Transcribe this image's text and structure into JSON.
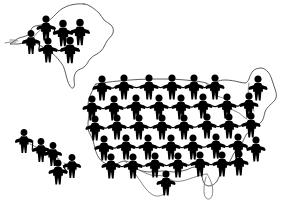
{
  "figure": {
    "background_color": "#ffffff",
    "figure_color": "#000000",
    "outline_color": "#4a4a4a",
    "canvas": {
      "width": 283,
      "height": 205
    }
  },
  "chart_data": {
    "type": "pictogram_map",
    "unit_symbol": "paper-doll human silhouette",
    "total_figures": 50,
    "regions": [
      {
        "name": "Alaska",
        "figure_count": 6
      },
      {
        "name": "Hawaii",
        "figure_count": 5
      },
      {
        "name": "Continental United States",
        "figure_count": 39
      }
    ]
  },
  "regions": {
    "alaska": {
      "name": "Alaska",
      "figures": [
        {
          "x": 46,
          "y": 28,
          "scale": 1.0
        },
        {
          "x": 63,
          "y": 33,
          "scale": 1.05
        },
        {
          "x": 80,
          "y": 32,
          "scale": 1.05
        },
        {
          "x": 31,
          "y": 42,
          "scale": 0.95
        },
        {
          "x": 48,
          "y": 50,
          "scale": 1.0
        },
        {
          "x": 70,
          "y": 50,
          "scale": 1.05
        }
      ]
    },
    "hawaii": {
      "name": "Hawaii",
      "figures": [
        {
          "x": 24,
          "y": 141,
          "scale": 0.95
        },
        {
          "x": 41,
          "y": 150,
          "scale": 0.95
        },
        {
          "x": 53,
          "y": 154,
          "scale": 0.95
        },
        {
          "x": 58,
          "y": 172,
          "scale": 1.0
        },
        {
          "x": 72,
          "y": 166,
          "scale": 0.95
        }
      ]
    },
    "continental": {
      "name": "Continental United States",
      "figures": [
        {
          "x": 102,
          "y": 88,
          "scale": 1.0
        },
        {
          "x": 124,
          "y": 87,
          "scale": 1.0
        },
        {
          "x": 149,
          "y": 87,
          "scale": 1.0
        },
        {
          "x": 172,
          "y": 87,
          "scale": 1.0
        },
        {
          "x": 194,
          "y": 87,
          "scale": 1.0
        },
        {
          "x": 215,
          "y": 87,
          "scale": 1.0
        },
        {
          "x": 258,
          "y": 88,
          "scale": 1.0
        },
        {
          "x": 92,
          "y": 108,
          "scale": 1.0
        },
        {
          "x": 114,
          "y": 108,
          "scale": 1.0
        },
        {
          "x": 136,
          "y": 107,
          "scale": 1.0
        },
        {
          "x": 159,
          "y": 107,
          "scale": 1.0
        },
        {
          "x": 181,
          "y": 107,
          "scale": 1.0
        },
        {
          "x": 203,
          "y": 106,
          "scale": 1.0
        },
        {
          "x": 227,
          "y": 106,
          "scale": 1.0
        },
        {
          "x": 249,
          "y": 105,
          "scale": 1.0
        },
        {
          "x": 95,
          "y": 128,
          "scale": 1.0
        },
        {
          "x": 117,
          "y": 127,
          "scale": 1.0
        },
        {
          "x": 139,
          "y": 127,
          "scale": 1.0
        },
        {
          "x": 162,
          "y": 127,
          "scale": 1.0
        },
        {
          "x": 184,
          "y": 127,
          "scale": 1.0
        },
        {
          "x": 207,
          "y": 126,
          "scale": 1.0
        },
        {
          "x": 229,
          "y": 126,
          "scale": 1.0
        },
        {
          "x": 251,
          "y": 125,
          "scale": 1.0
        },
        {
          "x": 104,
          "y": 148,
          "scale": 1.0
        },
        {
          "x": 126,
          "y": 147,
          "scale": 1.0
        },
        {
          "x": 148,
          "y": 147,
          "scale": 1.0
        },
        {
          "x": 171,
          "y": 147,
          "scale": 1.0
        },
        {
          "x": 193,
          "y": 147,
          "scale": 1.0
        },
        {
          "x": 216,
          "y": 146,
          "scale": 1.0
        },
        {
          "x": 238,
          "y": 146,
          "scale": 1.0
        },
        {
          "x": 256,
          "y": 149,
          "scale": 1.0
        },
        {
          "x": 111,
          "y": 166,
          "scale": 1.0
        },
        {
          "x": 133,
          "y": 166,
          "scale": 1.0
        },
        {
          "x": 155,
          "y": 165,
          "scale": 1.0
        },
        {
          "x": 178,
          "y": 165,
          "scale": 1.0
        },
        {
          "x": 200,
          "y": 164,
          "scale": 1.0
        },
        {
          "x": 222,
          "y": 164,
          "scale": 1.0
        },
        {
          "x": 239,
          "y": 163,
          "scale": 1.0
        },
        {
          "x": 166,
          "y": 183,
          "scale": 1.0
        }
      ]
    }
  }
}
